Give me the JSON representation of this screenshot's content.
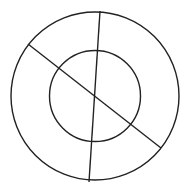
{
  "diagram": {
    "stroke_color": "#222222",
    "background": "#ffffff",
    "outer_circle": {
      "cx": 95,
      "cy": 96,
      "r": 84
    },
    "inner_circle": {
      "cx": 95,
      "cy": 96,
      "r": 45.5
    },
    "lines": [
      {
        "x1": 100,
        "y1": 11,
        "x2": 89,
        "y2": 182
      },
      {
        "x1": 28,
        "y1": 44,
        "x2": 161,
        "y2": 148
      }
    ]
  }
}
